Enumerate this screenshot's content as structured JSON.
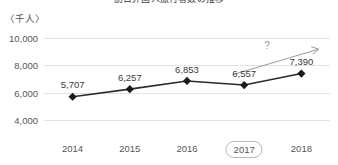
{
  "chart_data": {
    "type": "line",
    "title": "訪日外国人旅行者数の推移",
    "title_clipped": true,
    "unit_label": "〈千人〉",
    "xlabel": "",
    "ylabel": "",
    "categories": [
      "2014",
      "2015",
      "2016",
      "2017",
      "2018"
    ],
    "values": [
      5707,
      6257,
      6853,
      6557,
      7390
    ],
    "point_labels": [
      "5,707",
      "6,257",
      "6,853",
      "6,557",
      "7,390"
    ],
    "ylim": [
      3000,
      10700
    ],
    "yticks": [
      4000,
      6000,
      8000,
      10000
    ],
    "ytick_labels": [
      "4,000",
      "6,000",
      "8,000",
      "10,000"
    ],
    "grid": true,
    "legend": "none",
    "highlighted_category": "2017",
    "marker": "diamond",
    "annotations": [
      {
        "name": "question-mark",
        "text": "?"
      },
      {
        "name": "trend-arrow",
        "text": ""
      }
    ],
    "colors": {
      "line": "#2b2b2b",
      "marker": "#1a1a1a",
      "grid": "#e2e2e2",
      "text": "#555555",
      "annotation": "#9a9a9a",
      "highlight_border": "#b9b9b9",
      "background": "#ffffff"
    }
  }
}
